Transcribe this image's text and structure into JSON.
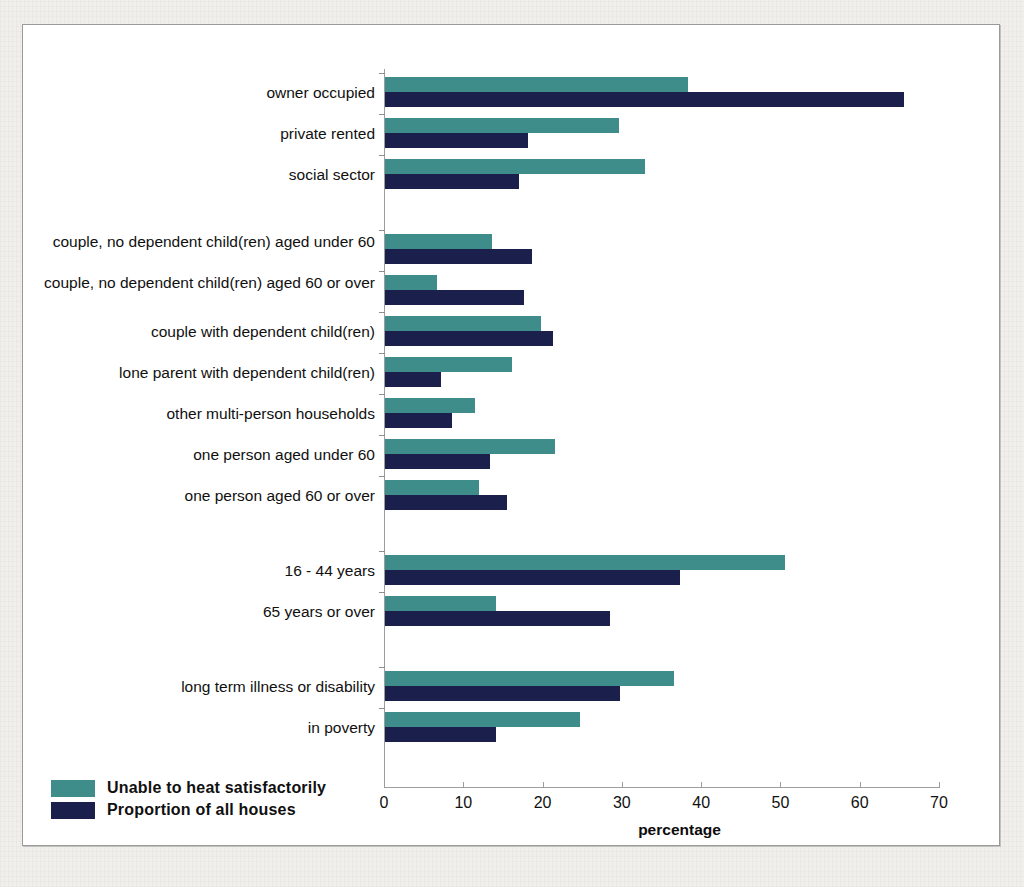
{
  "chart_data": {
    "type": "bar",
    "orientation": "horizontal",
    "title": "",
    "xlabel": "percentage",
    "ylabel": "",
    "xlim": [
      0,
      70
    ],
    "xticks": [
      0,
      10,
      20,
      30,
      40,
      50,
      60,
      70
    ],
    "grid": false,
    "legend_position": "bottom-left",
    "legend": [
      "Unable to heat satisfactorily",
      "Proportion of all houses"
    ],
    "series": [
      {
        "name": "Unable to heat satisfactorily",
        "color": "#3f8d8b",
        "values": [
          38.2,
          29.5,
          32.8,
          13.5,
          6.5,
          19.7,
          16.0,
          11.4,
          21.5,
          11.8,
          50.4,
          14.0,
          36.4,
          24.6
        ]
      },
      {
        "name": "Proportion of all houses",
        "color": "#1a1f4c",
        "values": [
          65.5,
          18.0,
          16.9,
          18.5,
          17.5,
          21.2,
          7.0,
          8.4,
          13.2,
          15.4,
          37.2,
          28.4,
          29.7,
          14.0
        ]
      }
    ],
    "categories": [
      "owner occupied",
      "private rented",
      "social sector",
      "couple, no dependent child(ren) aged under 60",
      "couple, no dependent child(ren) aged 60 or over",
      "couple with dependent child(ren)",
      "lone parent with dependent child(ren)",
      "other multi-person households",
      "one person aged under 60",
      "one person aged 60 or over",
      "16 - 44 years",
      "65 years or over",
      "long term illness or disability",
      "in poverty"
    ],
    "category_groups": [
      {
        "name": "tenure",
        "categories": [
          "owner occupied",
          "private rented",
          "social sector"
        ]
      },
      {
        "name": "household composition",
        "categories": [
          "couple, no dependent child(ren) aged under 60",
          "couple, no dependent child(ren) aged 60 or over",
          "couple with dependent child(ren)",
          "lone parent with dependent child(ren)",
          "other multi-person households",
          "one person aged under 60",
          "one person aged 60 or over"
        ]
      },
      {
        "name": "age",
        "categories": [
          "16 - 44 years",
          "65 years or over"
        ]
      },
      {
        "name": "circumstances",
        "categories": [
          "long term illness or disability",
          "in poverty"
        ]
      }
    ]
  },
  "axis": {
    "x_title": "percentage",
    "tick_labels": [
      "0",
      "10",
      "20",
      "30",
      "40",
      "50",
      "60",
      "70"
    ]
  },
  "legend": {
    "items": [
      {
        "label": "Unable to heat satisfactorily",
        "color": "#3f8d8b"
      },
      {
        "label": "Proportion of all houses",
        "color": "#1a1f4c"
      }
    ]
  },
  "labels": {
    "rows": [
      "owner occupied",
      "private rented",
      "social sector",
      "couple, no dependent child(ren) aged under 60",
      "couple, no dependent child(ren) aged 60 or over",
      "couple with dependent child(ren)",
      "lone parent with dependent child(ren)",
      "other multi-person households",
      "one person aged under 60",
      "one person aged 60 or over",
      "16 - 44 years",
      "65 years or over",
      "long term illness or disability",
      "in poverty"
    ]
  },
  "colors": {
    "series_teal": "#3f8d8b",
    "series_navy": "#1a1f4c",
    "panel_background": "#ffffff",
    "page_background": "#f1efeb",
    "axis": "#9d9d9d"
  }
}
